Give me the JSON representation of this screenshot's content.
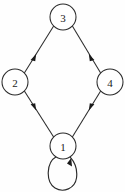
{
  "figure": {
    "background_color": "#fefefe",
    "stroke_color": "#2b2b2b",
    "label_color": "#1a1a1a",
    "width": 125,
    "height": 192
  },
  "graph": {
    "type": "directed-graph",
    "node_radius": 13,
    "nodes": [
      {
        "id": "3",
        "label": "3",
        "cx": 63,
        "cy": 17
      },
      {
        "id": "2",
        "label": "2",
        "cx": 15,
        "cy": 82
      },
      {
        "id": "4",
        "label": "4",
        "cx": 110,
        "cy": 82
      },
      {
        "id": "1",
        "label": "1",
        "cx": 63,
        "cy": 146
      }
    ],
    "edges": [
      {
        "id": "e32",
        "from": "3",
        "to": "2",
        "label": "",
        "arrow_at": "to"
      },
      {
        "id": "e34",
        "from": "3",
        "to": "4",
        "label": "",
        "arrow_at": "to"
      },
      {
        "id": "e12",
        "from": "1",
        "to": "2",
        "label": "",
        "arrow_at": "to"
      },
      {
        "id": "e14",
        "from": "1",
        "to": "4",
        "label": "",
        "arrow_at": "to"
      }
    ],
    "self_loops": [
      {
        "id": "loop1",
        "node": "1",
        "label": "",
        "direction": "below",
        "arrow_side": "right"
      }
    ]
  }
}
